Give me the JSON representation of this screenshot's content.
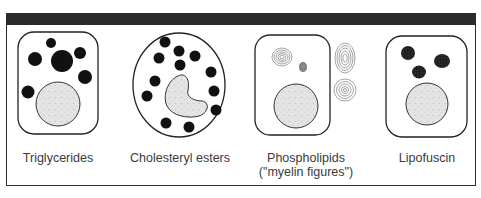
{
  "figure": {
    "header_color": "#2a2a2a",
    "panels": [
      {
        "id": "triglycerides",
        "label_lines": [
          "Triglycerides"
        ],
        "cell_shape": "rounded-rectangle",
        "inclusion_type": "solid black lipid droplets of varying size",
        "inclusion_count": 6,
        "nucleus_shape": "round"
      },
      {
        "id": "cholesteryl-esters",
        "label_lines": [
          "Cholesteryl esters"
        ],
        "cell_shape": "oval",
        "inclusion_type": "small uniform black droplets",
        "inclusion_count": 12,
        "nucleus_shape": "bean / kidney"
      },
      {
        "id": "phospholipids",
        "label_lines": [
          "Phospholipids",
          "(\"myelin figures\")"
        ],
        "cell_shape": "rounded-rectangle",
        "inclusion_type": "concentric lamellar whorls (myelin figures)",
        "inclusion_count": 4,
        "nucleus_shape": "round"
      },
      {
        "id": "lipofuscin",
        "label_lines": [
          "Lipofuscin"
        ],
        "cell_shape": "rounded-rectangle",
        "inclusion_type": "dark granular pigment clumps",
        "inclusion_count": 3,
        "nucleus_shape": "round"
      }
    ]
  }
}
